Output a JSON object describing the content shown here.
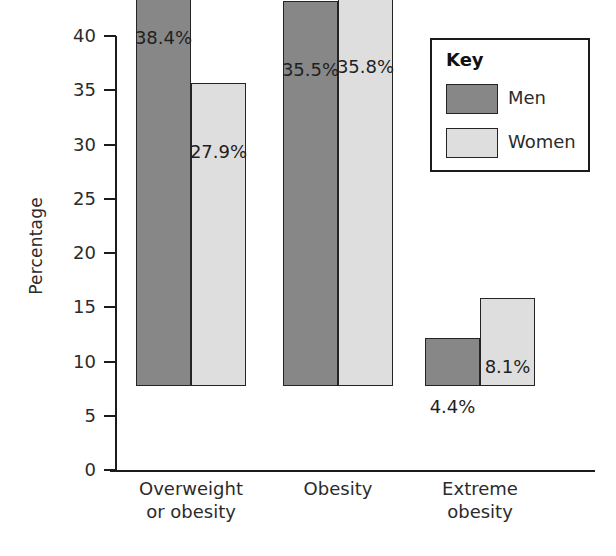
{
  "chart_data": {
    "type": "bar",
    "title": "",
    "xlabel": "",
    "ylabel": "Percentage",
    "ylim": [
      0,
      40
    ],
    "ytick_step": 5,
    "yticks": [
      40,
      35,
      30,
      25,
      20,
      15,
      10,
      5,
      0
    ],
    "ytick_labels": [
      "40",
      "35",
      "30",
      "25",
      "20",
      "15",
      "10",
      "5",
      "0"
    ],
    "grid": false,
    "legend_position": "top-right",
    "legend_title": "Key",
    "categories": [
      "Overweight or obesity",
      "Obesity",
      "Extreme obesity"
    ],
    "category_lines": [
      [
        "Overweight",
        "or obesity"
      ],
      [
        "Obesity",
        ""
      ],
      [
        "Extreme",
        "obesity"
      ]
    ],
    "series": [
      {
        "name": "Men",
        "color": "#878787",
        "values": [
          38.4,
          35.5,
          4.4
        ],
        "value_labels": [
          "38.4%",
          "35.5%",
          "4.4%"
        ]
      },
      {
        "name": "Women",
        "color": "#dedede",
        "values": [
          27.9,
          35.8,
          8.1
        ],
        "value_labels": [
          "27.9%",
          "35.8%",
          "8.1%"
        ]
      }
    ]
  },
  "colors": {
    "men": "#878787",
    "women": "#dedede",
    "axis": "#1b1b1b",
    "text": "#2b2b2b",
    "background": "#ffffff"
  },
  "legend": {
    "title": "Key",
    "items": [
      {
        "label": "Men",
        "color": "#878787"
      },
      {
        "label": "Women",
        "color": "#dedede"
      }
    ]
  },
  "axis": {
    "y_title": "Percentage",
    "y_tick_labels": [
      "40",
      "35",
      "30",
      "25",
      "20",
      "15",
      "10",
      "5",
      "0"
    ]
  },
  "bars": [
    {
      "label": "38.4%",
      "series": "Men",
      "category": "Overweight or obesity"
    },
    {
      "label": "27.9%",
      "series": "Women",
      "category": "Overweight or obesity"
    },
    {
      "label": "35.5%",
      "series": "Men",
      "category": "Obesity"
    },
    {
      "label": "35.8%",
      "series": "Women",
      "category": "Obesity"
    },
    {
      "label": "4.4%",
      "series": "Men",
      "category": "Extreme obesity"
    },
    {
      "label": "8.1%",
      "series": "Women",
      "category": "Extreme obesity"
    }
  ],
  "categories": [
    {
      "line1": "Overweight",
      "line2": "or obesity"
    },
    {
      "line1": "Obesity",
      "line2": ""
    },
    {
      "line1": "Extreme",
      "line2": "obesity"
    }
  ]
}
